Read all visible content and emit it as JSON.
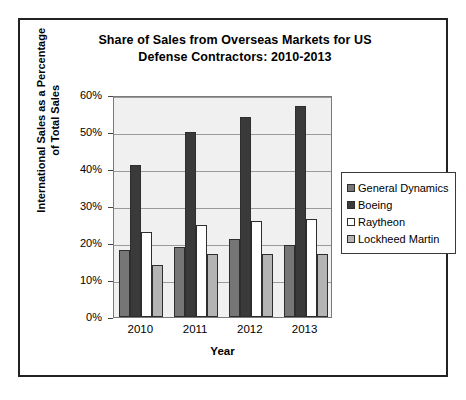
{
  "chart_data": {
    "type": "bar",
    "title": "Share of Sales from Overseas Markets for US Defense Contractors: 2010-2013",
    "title_line1": "Share of Sales from Overseas Markets for US",
    "title_line2": "Defense Contractors: 2010-2013",
    "xlabel": "Year",
    "ylabel": "International Sales as a Percentage of Total Sales",
    "ylabel_line1": "International Sales as a Percentage",
    "ylabel_line2": "of Total Sales",
    "categories": [
      "2010",
      "2011",
      "2012",
      "2013"
    ],
    "ylim": [
      0,
      60
    ],
    "ytick_labels": [
      "0%",
      "10%",
      "20%",
      "30%",
      "40%",
      "50%",
      "60%"
    ],
    "ytick_values": [
      0,
      10,
      20,
      30,
      40,
      50,
      60
    ],
    "grid": true,
    "legend_position": "right",
    "series": [
      {
        "name": "General Dynamics",
        "color": "#767676",
        "values": [
          18,
          19,
          21,
          19.5
        ]
      },
      {
        "name": "Boeing",
        "color": "#3a3a3a",
        "values": [
          41,
          50,
          54,
          57
        ]
      },
      {
        "name": "Raytheon",
        "color": "#ffffff",
        "values": [
          23,
          25,
          26,
          26.5
        ]
      },
      {
        "name": "Lockheed Martin",
        "color": "#b4b4b4",
        "values": [
          14,
          17,
          17,
          17
        ]
      }
    ]
  }
}
